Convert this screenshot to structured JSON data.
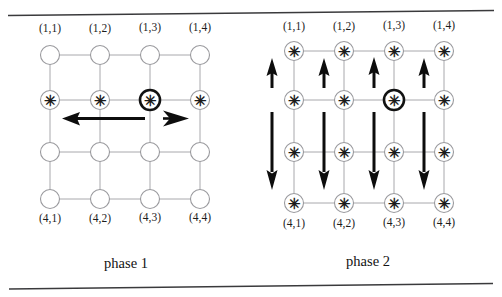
{
  "figure": {
    "type": "diagram",
    "colors": {
      "grid_line": "#a8a8ac",
      "node_stroke": "#9a9a9e",
      "highlight_node_stroke": "#121212",
      "arrow": "#0d0d0d",
      "rule": "#3a3a3c",
      "background": "#ffffff"
    },
    "rules": {
      "top_label": "top-horizontal-rule",
      "bottom_label": "bottom-horizontal-rule"
    }
  },
  "panels": [
    {
      "id": "phase-1",
      "caption": "phase 1",
      "grid": {
        "rows": 4,
        "cols": 4
      },
      "top_labels": [
        "(1,1)",
        "(1,2)",
        "(1,3)",
        "(1,4)"
      ],
      "bottom_labels": [
        "(4,1)",
        "(4,2)",
        "(4,3)",
        "(4,4)"
      ],
      "marked_nodes": [
        {
          "row": 2,
          "col": 1,
          "glyph": "✳",
          "highlight": false
        },
        {
          "row": 2,
          "col": 2,
          "glyph": "✳",
          "highlight": false
        },
        {
          "row": 2,
          "col": 3,
          "glyph": "✳",
          "highlight": true
        },
        {
          "row": 2,
          "col": 4,
          "glyph": "✳",
          "highlight": false
        }
      ],
      "empty_nodes": [
        {
          "row": 1,
          "col": 1
        },
        {
          "row": 1,
          "col": 2
        },
        {
          "row": 1,
          "col": 3
        },
        {
          "row": 1,
          "col": 4
        },
        {
          "row": 3,
          "col": 1
        },
        {
          "row": 3,
          "col": 2
        },
        {
          "row": 3,
          "col": 3
        },
        {
          "row": 3,
          "col": 4
        },
        {
          "row": 4,
          "col": 1
        },
        {
          "row": 4,
          "col": 2
        },
        {
          "row": 4,
          "col": 3
        },
        {
          "row": 4,
          "col": 4
        }
      ],
      "arrows": [
        {
          "id": "left-long-arrow",
          "direction": "left",
          "length": "long"
        },
        {
          "id": "right-short-arrow",
          "direction": "right",
          "length": "short"
        }
      ]
    },
    {
      "id": "phase-2",
      "caption": "phase 2",
      "grid": {
        "rows": 4,
        "cols": 4
      },
      "top_labels": [
        "(1,1)",
        "(1,2)",
        "(1,3)",
        "(1,4)"
      ],
      "bottom_labels": [
        "(4,1)",
        "(4,2)",
        "(4,3)",
        "(4,4)"
      ],
      "marked_nodes": [
        {
          "row": 1,
          "col": 1,
          "glyph": "✳",
          "highlight": false
        },
        {
          "row": 1,
          "col": 2,
          "glyph": "✳",
          "highlight": false
        },
        {
          "row": 1,
          "col": 3,
          "glyph": "✳",
          "highlight": false
        },
        {
          "row": 1,
          "col": 4,
          "glyph": "✳",
          "highlight": false
        },
        {
          "row": 2,
          "col": 1,
          "glyph": "✳",
          "highlight": false
        },
        {
          "row": 2,
          "col": 2,
          "glyph": "✳",
          "highlight": false
        },
        {
          "row": 2,
          "col": 3,
          "glyph": "✳",
          "highlight": true
        },
        {
          "row": 2,
          "col": 4,
          "glyph": "✳",
          "highlight": false
        },
        {
          "row": 3,
          "col": 1,
          "glyph": "✳",
          "highlight": false
        },
        {
          "row": 3,
          "col": 2,
          "glyph": "✳",
          "highlight": false
        },
        {
          "row": 3,
          "col": 3,
          "glyph": "✳",
          "highlight": false
        },
        {
          "row": 3,
          "col": 4,
          "glyph": "✳",
          "highlight": false
        },
        {
          "row": 4,
          "col": 1,
          "glyph": "✳",
          "highlight": false
        },
        {
          "row": 4,
          "col": 2,
          "glyph": "✳",
          "highlight": false
        },
        {
          "row": 4,
          "col": 3,
          "glyph": "✳",
          "highlight": false
        },
        {
          "row": 4,
          "col": 4,
          "glyph": "✳",
          "highlight": false
        }
      ],
      "empty_nodes": [],
      "arrows": [
        {
          "id": "up-arrow-col1",
          "direction": "up",
          "column": 1,
          "span": "row2-to-row1"
        },
        {
          "id": "up-arrow-col2",
          "direction": "up",
          "column": 2,
          "span": "row2-to-row1"
        },
        {
          "id": "up-arrow-col3",
          "direction": "up",
          "column": 3,
          "span": "row2-to-row1"
        },
        {
          "id": "up-arrow-col4",
          "direction": "up",
          "column": 4,
          "span": "row2-to-row1"
        },
        {
          "id": "down-arrow-col1",
          "direction": "down",
          "column": 1,
          "span": "row2-to-row4"
        },
        {
          "id": "down-arrow-col2",
          "direction": "down",
          "column": 2,
          "span": "row2-to-row4"
        },
        {
          "id": "down-arrow-col3",
          "direction": "down",
          "column": 3,
          "span": "row2-to-row4"
        },
        {
          "id": "down-arrow-col4",
          "direction": "down",
          "column": 4,
          "span": "row2-to-row4"
        }
      ]
    }
  ]
}
